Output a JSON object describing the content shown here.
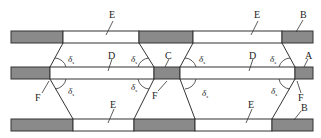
{
  "diagram": {
    "colors": {
      "filled": "#8a8a8a",
      "empty": "#ffffff",
      "stroke": "#333333"
    },
    "rows": [
      {
        "name": "top-plate",
        "y": 31,
        "h": 12,
        "segments": [
          {
            "x": 11,
            "w": 52,
            "fill": "gray"
          },
          {
            "x": 63,
            "w": 76,
            "fill": "white"
          },
          {
            "x": 139,
            "w": 54,
            "fill": "gray"
          },
          {
            "x": 193,
            "w": 89,
            "fill": "white"
          },
          {
            "x": 282,
            "w": 31,
            "fill": "gray"
          }
        ]
      },
      {
        "name": "middle-plate",
        "y": 67,
        "h": 12,
        "segments": [
          {
            "x": 11,
            "w": 39,
            "fill": "gray"
          },
          {
            "x": 50,
            "w": 104,
            "fill": "white"
          },
          {
            "x": 154,
            "w": 26,
            "fill": "gray"
          },
          {
            "x": 180,
            "w": 115,
            "fill": "white"
          },
          {
            "x": 295,
            "w": 18,
            "fill": "gray"
          }
        ]
      },
      {
        "name": "bottom-plate",
        "y": 119,
        "h": 12,
        "segments": [
          {
            "x": 11,
            "w": 62,
            "fill": "gray"
          },
          {
            "x": 73,
            "w": 61,
            "fill": "white"
          },
          {
            "x": 134,
            "w": 61,
            "fill": "gray"
          },
          {
            "x": 195,
            "w": 77,
            "fill": "white"
          },
          {
            "x": 272,
            "w": 41,
            "fill": "gray"
          }
        ]
      }
    ],
    "labels": {
      "E_top_left": "E",
      "E_top_right": "E",
      "B_top": "B",
      "D_left": "D",
      "D_right": "D",
      "C": "C",
      "A": "A",
      "F_left": "F",
      "F_center": "F",
      "F_right": "F",
      "E_bottom_left": "E",
      "E_bottom_right": "E",
      "B_bottom": "B",
      "delta_symbol": "δ",
      "delta_subscript": "s"
    }
  }
}
